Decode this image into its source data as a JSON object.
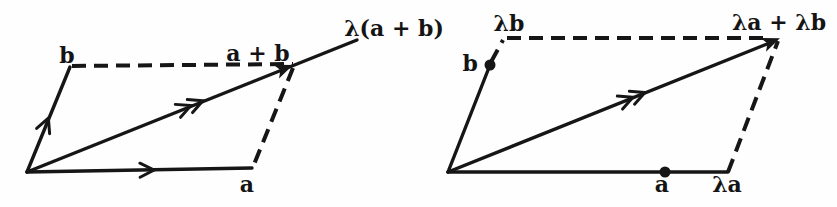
{
  "figure": {
    "background": "#fefefe",
    "ink_color": "#161616",
    "left_diagram": {
      "labels": {
        "b": "b",
        "sum": "a + b",
        "scaled_sum": "λ(a + b)",
        "a": "a"
      }
    },
    "right_diagram": {
      "labels": {
        "lambda_b": "λb",
        "b": "b",
        "scaled_sum": "λa + λb",
        "a": "a",
        "lambda_a": "λa"
      }
    }
  }
}
